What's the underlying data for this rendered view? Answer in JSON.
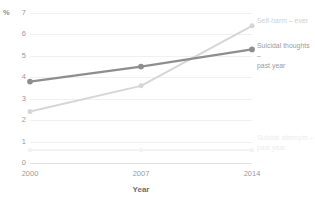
{
  "chart_data": {
    "type": "line",
    "title": "",
    "subtitle": "",
    "xlabel": "Year",
    "ylabel": "",
    "unit_symbol": "%",
    "x": [
      2000,
      2007,
      2014
    ],
    "categories": [
      "2000",
      "2007",
      "2014"
    ],
    "xlim": [
      2000,
      2014
    ],
    "ylim": [
      0,
      7
    ],
    "yticks": [
      0,
      1,
      2,
      3,
      4,
      5,
      6,
      7
    ],
    "grid": true,
    "legend_position": "right-inline",
    "series": [
      {
        "name": "Self-harm – ever",
        "label_lines": "Self-harm – ever",
        "values": [
          2.4,
          3.6,
          6.4
        ],
        "color": "#d6d6d6",
        "label_color": "#cfcfcf",
        "width": 2.0,
        "marker": true,
        "label_y": 16
      },
      {
        "name": "Suicidal thoughts – past year",
        "label_lines": "Suicidal thoughts –\npast year",
        "values": [
          3.8,
          4.5,
          5.3
        ],
        "color": "#8e8e8e",
        "label_color": "#9b9b9b",
        "width": 2.3,
        "marker": true,
        "label_y": 41
      },
      {
        "name": "Suicide attempts – past year",
        "label_lines": "Suicide attempts –\npast year",
        "values": [
          0.6,
          0.6,
          0.6
        ],
        "color": "#f2f2f2",
        "label_color": "#ececec",
        "width": 1.8,
        "marker": true,
        "label_y": 133
      }
    ]
  }
}
